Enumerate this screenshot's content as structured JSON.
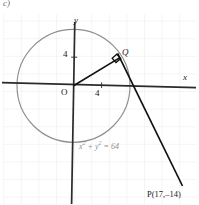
{
  "figure": {
    "part_label": "c)",
    "axes": {
      "y_label": "y",
      "x_label": "x",
      "origin_label": "O",
      "y_tick_label": "4",
      "x_tick_label": "4"
    },
    "points": {
      "tangent_point_label": "Q",
      "external_point_label": "P(17,–14)"
    },
    "circle": {
      "equation": "x² + y² = 64",
      "equation_base": "x",
      "equation_mid": " + y",
      "equation_tail": " = 64",
      "exponent": "2",
      "radius_units": 8,
      "center": "(0, 0)"
    },
    "markers": {
      "right_angle": "right-angle-square"
    },
    "colors": {
      "grid": "#e8e8e8",
      "circle": "#8e8e8e",
      "axis": "#2b2b2b",
      "line": "#111111",
      "equation_text": "#8f8f8f",
      "background": "#ffffff"
    }
  }
}
